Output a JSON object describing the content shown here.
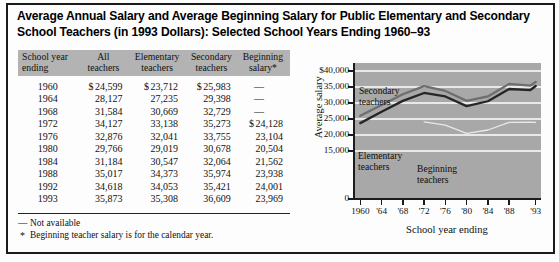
{
  "title": "Average Annual Salary and Average Beginning Salary for Public Elementary and Secondary School Teachers (in 1993 Dollars): Selected School Years Ending 1960–93",
  "table": {
    "headers": [
      {
        "line1": "School year",
        "line2": "ending"
      },
      {
        "line1": "All",
        "line2": "teachers"
      },
      {
        "line1": "Elementary",
        "line2": "teachers"
      },
      {
        "line1": "Secondary",
        "line2": "teachers"
      },
      {
        "line1": "Beginning",
        "line2": "salary*"
      }
    ],
    "rows": [
      {
        "year": "1960",
        "all": "$ 24,599",
        "elementary": "$ 23,712",
        "secondary": "$ 25,983",
        "beginning": "—"
      },
      {
        "year": "1964",
        "all": "28,127",
        "elementary": "27,235",
        "secondary": "29,398",
        "beginning": "—"
      },
      {
        "year": "1968",
        "all": "31,584",
        "elementary": "30,669",
        "secondary": "32,729",
        "beginning": "—"
      },
      {
        "year": "1972",
        "all": "34,127",
        "elementary": "33,138",
        "secondary": "35,273",
        "beginning": "$ 24,128"
      },
      {
        "year": "1976",
        "all": "32,876",
        "elementary": "32,041",
        "secondary": "33,755",
        "beginning": "23,104"
      },
      {
        "year": "1980",
        "all": "29,766",
        "elementary": "29,019",
        "secondary": "30,678",
        "beginning": "20,504"
      },
      {
        "year": "1984",
        "all": "31,184",
        "elementary": "30,547",
        "secondary": "32,064",
        "beginning": "21,562"
      },
      {
        "year": "1988",
        "all": "35,017",
        "elementary": "34,373",
        "secondary": "35,974",
        "beginning": "23,938"
      },
      {
        "year": "1992",
        "all": "34,618",
        "elementary": "34,053",
        "secondary": "35,421",
        "beginning": "24,001"
      },
      {
        "year": "1993",
        "all": "35,873",
        "elementary": "35,308",
        "secondary": "36,609",
        "beginning": "23,969"
      }
    ]
  },
  "footnotes": [
    {
      "mark": "—",
      "text": "Not available"
    },
    {
      "mark": "*",
      "text": "Beginning teacher salary is for the calendar year."
    }
  ],
  "chart_data": {
    "type": "line",
    "title": "",
    "xlabel": "School year ending",
    "ylabel": "Average salary",
    "x": [
      1960,
      1964,
      1968,
      1972,
      1976,
      1980,
      1984,
      1988,
      1992,
      1993
    ],
    "xtick_labels": [
      "1960",
      "'64",
      "'68",
      "'72",
      "'76",
      "'80",
      "'84",
      "'88",
      "'93"
    ],
    "xtick_values": [
      1960,
      1964,
      1968,
      1972,
      1976,
      1980,
      1984,
      1988,
      1993
    ],
    "ytick_labels": [
      "$40,000",
      "35,000",
      "30,000",
      "25,000",
      "20,000",
      "15,000",
      "0"
    ],
    "ytick_values": [
      40000,
      35000,
      30000,
      25000,
      20000,
      15000,
      0
    ],
    "ylim": [
      0,
      42500
    ],
    "xlim": [
      1959,
      1994
    ],
    "grid": "horizontal-white",
    "plot_background": "#a8a8a8",
    "legend": "inline-labels",
    "series": [
      {
        "name": "Secondary teachers",
        "color": "#6e6e6e",
        "label_position": "upper-left",
        "values": [
          25983,
          29398,
          32729,
          35273,
          33755,
          30678,
          32064,
          35974,
          35421,
          36609
        ]
      },
      {
        "name": "Elementary teachers",
        "color": "#262626",
        "label_position": "lower-left",
        "values": [
          23712,
          27235,
          30669,
          33138,
          32041,
          29019,
          30547,
          34373,
          34053,
          35308
        ]
      },
      {
        "name": "Beginning teachers",
        "color": "#e8e8e8",
        "label_position": "lower-center",
        "values": [
          null,
          null,
          null,
          24128,
          23104,
          20504,
          21562,
          23938,
          24001,
          23969
        ]
      }
    ]
  }
}
